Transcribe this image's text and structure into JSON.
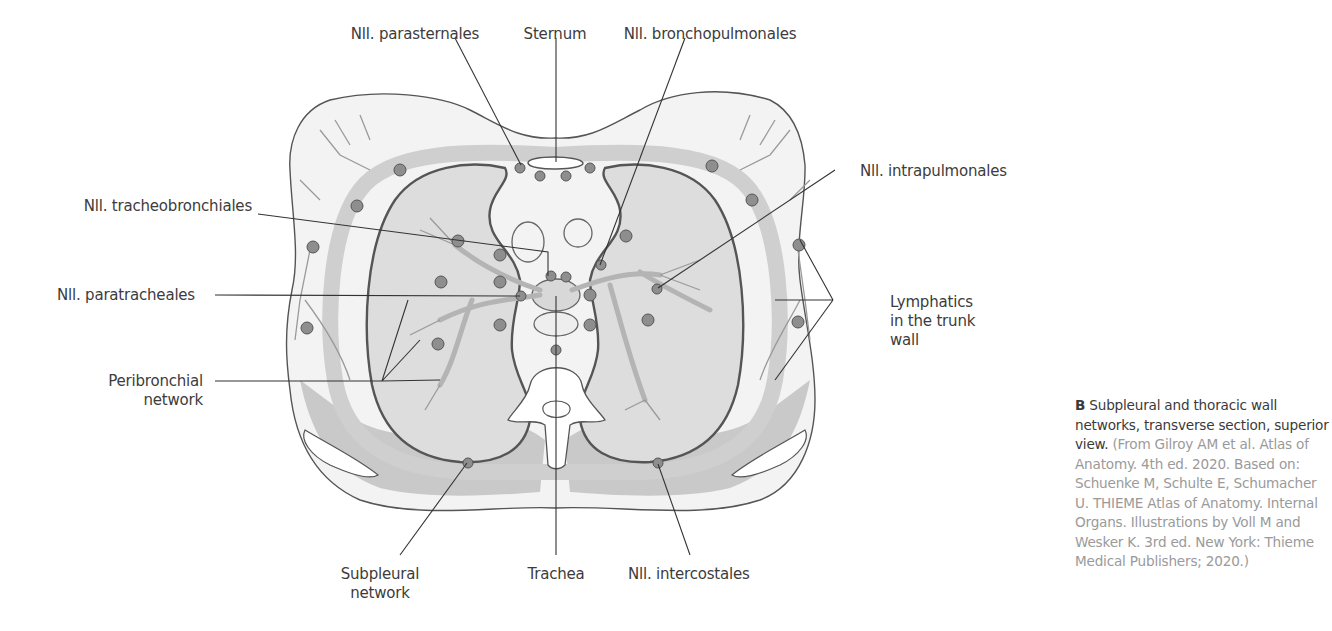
{
  "figure": {
    "title": "Subpleural and thoracic wall networks, transverse section, superior view",
    "colors": {
      "lung_fill": "#dcdcdc",
      "body_fill": "#f2f2f2",
      "muscle_fill": "#c9c9c9",
      "node_fill": "#8e8e8e",
      "vessel": "#9a9a9a",
      "outline": "#555555",
      "leader": "#333333"
    },
    "labels": {
      "nll_parasternales": "Nll. parasternales",
      "sternum": "Sternum",
      "nll_bronchopulmonales": "Nll. bronchopulmonales",
      "nll_intrapulmonales": "Nll. intrapulmonales",
      "nll_tracheobronchiales": "Nll. tracheobronchiales",
      "nll_paratracheales": "Nll. paratracheales",
      "peribronchial_line1": "Peribronchial",
      "peribronchial_line2": "network",
      "lymphatics_line1": "Lymphatics",
      "lymphatics_line2": "in the trunk",
      "lymphatics_line3": "wall",
      "subpleural_line1": "Subpleural",
      "subpleural_line2": "network",
      "trachea": "Trachea",
      "nll_intercostales": "Nll. intercostales"
    }
  },
  "caption": {
    "letter": "B",
    "bold_text": "Subpleural and thoracic wall networks, transverse section, superior view.",
    "source_text": "(From Gilroy AM et al. Atlas of Anatomy. 4th ed. 2020. Based on: Schuenke M, Schulte E, Schumacher U. THIEME Atlas of Anatomy. Internal Organs. Illustrations by Voll M and Wesker K. 3rd ed. New York: Thieme Medical Publishers; 2020.)"
  }
}
